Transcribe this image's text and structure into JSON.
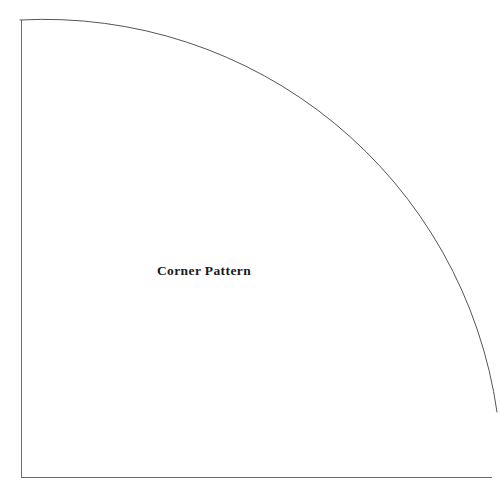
{
  "figure": {
    "name": "corner-pattern-figure",
    "width": 500,
    "height": 494,
    "background_color": "#ffffff"
  },
  "label": {
    "text": "Corner Pattern",
    "color": "#1a1a1a",
    "font_style": "bold serif",
    "font_size_px": 13.5,
    "center_x": 204,
    "center_y": 271
  },
  "frame": {
    "stroke_color": "#6e6e6e",
    "stroke_width": 1,
    "edges": [
      {
        "name": "left-border",
        "x1": 21,
        "y1": 20,
        "x2": 21,
        "y2": 477
      },
      {
        "name": "bottom-border",
        "x1": 21,
        "y1": 477,
        "x2": 492,
        "y2": 477
      }
    ],
    "top_border_present": false,
    "right_border_present": false
  },
  "arc": {
    "name": "quarter-circle-arc",
    "stroke_color": "#555555",
    "stroke_width": 1,
    "fill": "none",
    "center_x": 20,
    "center_y": 477,
    "radius": 457,
    "start_point": [
      20,
      20
    ],
    "end_point": [
      497,
      412
    ],
    "sweep_description": "quarter circle from top-left corner curving down to the right edge",
    "sampled_points": [
      [
        20,
        20
      ],
      [
        60,
        20
      ],
      [
        160,
        28
      ],
      [
        230,
        62
      ],
      [
        300,
        93
      ],
      [
        345,
        130
      ],
      [
        365,
        152
      ],
      [
        405,
        205
      ],
      [
        472,
        315
      ],
      [
        497,
        412
      ]
    ]
  },
  "chart_data": {
    "type": "line",
    "title": "Corner Pattern",
    "xlabel": "",
    "ylabel": "",
    "grid": false,
    "legend": null,
    "xlim": [
      0,
      500
    ],
    "ylim": [
      0,
      494
    ],
    "series": [
      {
        "name": "quarter-circle-arc",
        "color": "#555555",
        "x": [
          20,
          60,
          160,
          230,
          300,
          345,
          365,
          405,
          472,
          497
        ],
        "y": [
          20,
          20,
          28,
          62,
          93,
          130,
          152,
          205,
          315,
          412
        ]
      }
    ],
    "annotations": [
      {
        "text": "Corner Pattern",
        "x": 204,
        "y": 271
      }
    ]
  }
}
